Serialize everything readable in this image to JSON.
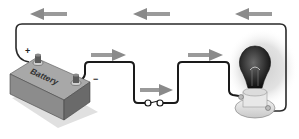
{
  "diagram": {
    "components": {
      "battery": {
        "label": "Battery",
        "positive_sign": "+",
        "negative_sign": "−"
      },
      "switch": {
        "state": "closed"
      },
      "bulb": {
        "state": "lit"
      }
    },
    "arrows": {
      "top_wire": [
        "left",
        "left",
        "left"
      ],
      "middle": [
        "right",
        "right",
        "right"
      ]
    },
    "colors": {
      "wire": "#222222",
      "arrow": "#8a8a8a",
      "battery_top": "#9a9a9a",
      "battery_side": "#6e6e6e",
      "glow": "#d8d8d8"
    }
  }
}
